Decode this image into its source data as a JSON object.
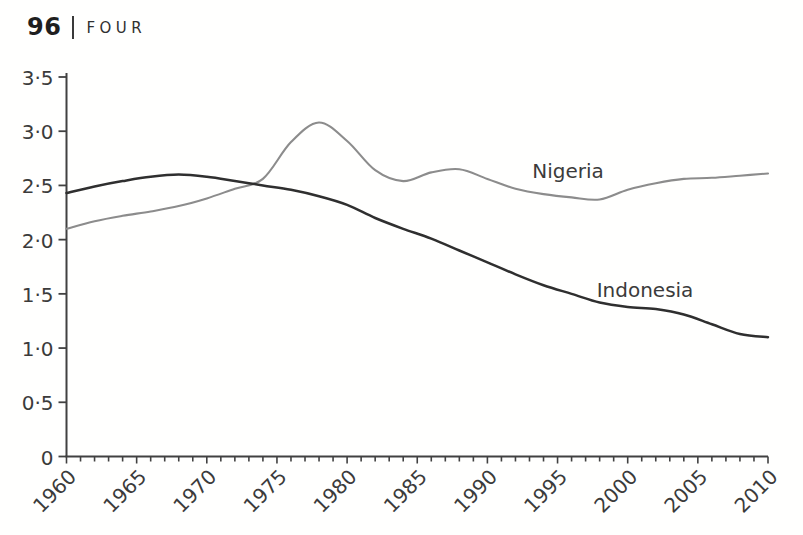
{
  "page": {
    "number": "96",
    "chapter": "FOUR"
  },
  "chart_data": {
    "type": "line",
    "title": "",
    "xlabel": "",
    "ylabel": "",
    "x": [
      1960,
      1962,
      1964,
      1966,
      1968,
      1970,
      1972,
      1974,
      1976,
      1978,
      1980,
      1982,
      1984,
      1986,
      1988,
      1990,
      1992,
      1994,
      1996,
      1998,
      2000,
      2002,
      2004,
      2006,
      2008,
      2010
    ],
    "series": [
      {
        "name": "Nigeria",
        "color": "#8c8c8c",
        "values": [
          2.1,
          2.17,
          2.22,
          2.26,
          2.31,
          2.38,
          2.47,
          2.56,
          2.9,
          3.08,
          2.91,
          2.64,
          2.54,
          2.62,
          2.65,
          2.56,
          2.47,
          2.42,
          2.39,
          2.37,
          2.46,
          2.52,
          2.56,
          2.57,
          2.59,
          2.61
        ]
      },
      {
        "name": "Indonesia",
        "color": "#2f2f2f",
        "values": [
          2.43,
          2.49,
          2.54,
          2.58,
          2.6,
          2.58,
          2.54,
          2.5,
          2.46,
          2.4,
          2.32,
          2.2,
          2.1,
          2.01,
          1.9,
          1.79,
          1.68,
          1.58,
          1.5,
          1.42,
          1.38,
          1.36,
          1.31,
          1.22,
          1.13,
          1.1
        ]
      }
    ],
    "xlim": [
      1960,
      2010
    ],
    "ylim": [
      0,
      3.5
    ],
    "yticks": [
      0,
      0.5,
      1.0,
      1.5,
      2.0,
      2.5,
      3.0,
      3.5
    ],
    "ytick_labels": [
      "0",
      "0·5",
      "1·0",
      "1·5",
      "2·0",
      "2·5",
      "3·0",
      "3·5"
    ],
    "xtick_labels": [
      "1960",
      "1965",
      "1970",
      "1975",
      "1980",
      "1985",
      "1990",
      "1995",
      "2000",
      "2005",
      "2010"
    ],
    "minor_xticks_every_years": 1,
    "grid": false,
    "legend": "inline-labels",
    "axis_color": "#414141",
    "text_color": "#3b3b3b"
  }
}
